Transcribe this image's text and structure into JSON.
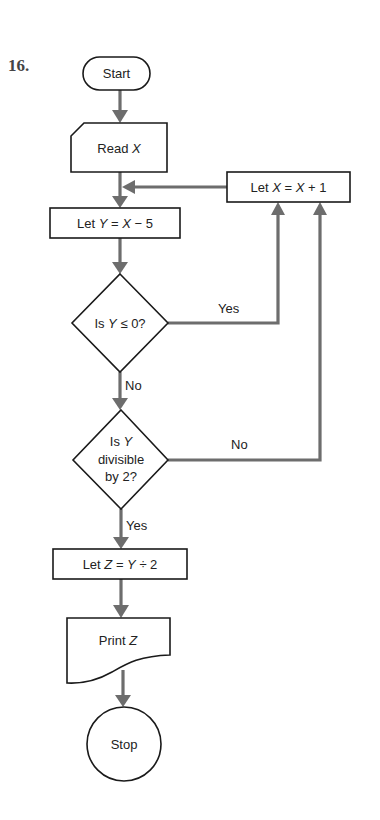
{
  "problem_number": "16.",
  "colors": {
    "connector": "#6d6d6d",
    "outline": "#1a1a1a",
    "background": "#ffffff"
  },
  "nodes": {
    "start": {
      "type": "terminal",
      "label": "Start"
    },
    "read_x": {
      "type": "input",
      "label_prefix": "Read ",
      "label_var": "X"
    },
    "let_y": {
      "type": "process",
      "parts": [
        "Let ",
        "Y",
        " = ",
        "X",
        " − 5"
      ]
    },
    "let_x": {
      "type": "process",
      "parts": [
        "Let ",
        "X",
        " = ",
        "X",
        " + 1"
      ]
    },
    "decision_1": {
      "type": "decision",
      "parts": [
        "Is ",
        "Y",
        " ≤ 0?"
      ]
    },
    "decision_2": {
      "type": "decision",
      "line1_prefix": "Is ",
      "line1_var": "Y",
      "line2": "divisible",
      "line3": "by 2?"
    },
    "let_z": {
      "type": "process",
      "parts": [
        "Let ",
        "Z",
        " = ",
        "Y",
        " ÷ 2"
      ]
    },
    "print_z": {
      "type": "output",
      "label_prefix": "Print ",
      "label_var": "Z"
    },
    "stop": {
      "type": "terminal",
      "label": "Stop"
    }
  },
  "edges": {
    "d1_yes": "Yes",
    "d1_no": "No",
    "d2_no": "No",
    "d2_yes": "Yes"
  }
}
